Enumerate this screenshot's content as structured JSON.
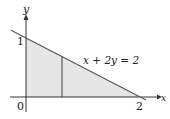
{
  "diagram": {
    "type": "region-under-line",
    "axes": {
      "x_label": "x",
      "y_label": "y",
      "origin_label": "0",
      "x_tick_label": "2",
      "y_tick_label": "1"
    },
    "line": {
      "equation": "x + 2y = 2",
      "x_intercept": 2,
      "y_intercept": 1
    },
    "region": {
      "description": "Triangle bounded by x-axis, y-axis and line x + 2y = 2",
      "fill": "#e6e6e6"
    },
    "vertical_strip_label": "",
    "colors": {
      "axis": "#333333",
      "line": "#555555",
      "region": "#e6e6e6"
    }
  }
}
